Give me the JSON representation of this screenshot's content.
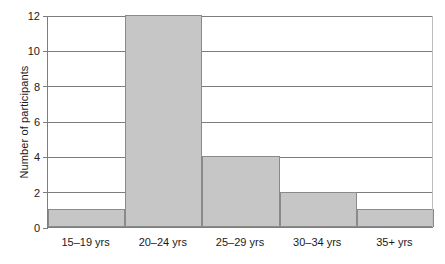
{
  "chart_data": {
    "type": "bar",
    "title": "",
    "subtitle": "",
    "xlabel": "",
    "ylabel": "Number of participants",
    "categories": [
      "15–19 yrs",
      "20–24 yrs",
      "25–29 yrs",
      "30–34 yrs",
      "35+ yrs"
    ],
    "values": [
      1,
      12,
      4,
      2,
      1
    ],
    "ylim": [
      0,
      12
    ],
    "ytick_labels": [
      "0",
      "2",
      "4",
      "6",
      "8",
      "10",
      "12"
    ],
    "ytick_values": [
      0,
      2,
      4,
      6,
      8,
      10,
      12
    ],
    "ytick_step": 2,
    "grid": "horizontal",
    "legend": "none",
    "bar_gap": 0,
    "colors": {
      "bar_fill": "#c6c6c6",
      "bar_edge": "#8a8a8a",
      "gridline": "#7d7d7d",
      "axis": "#7d7d7d",
      "text": "#1a1a1a",
      "background": "#ffffff"
    }
  }
}
